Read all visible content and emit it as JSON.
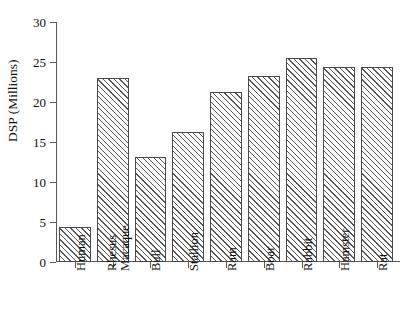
{
  "chart_data": {
    "type": "bar",
    "title": "",
    "subtitle": "",
    "xlabel": "",
    "ylabel": "DSP (Millions)",
    "categories": [
      "Human",
      "Rhesus Macaque",
      "Bull",
      "Stallion",
      "Ram",
      "Boar",
      "Rabbit",
      "Hamster",
      "Rat"
    ],
    "category_lines": [
      [
        "Human"
      ],
      [
        "Rhesus",
        "Macaque"
      ],
      [
        "Bull"
      ],
      [
        "Stallion"
      ],
      [
        "Ram"
      ],
      [
        "Boar"
      ],
      [
        "Rabbit"
      ],
      [
        "Hamster"
      ],
      [
        "Rat"
      ]
    ],
    "values": [
      4.4,
      23.0,
      13.1,
      16.2,
      21.2,
      23.3,
      25.5,
      24.4,
      24.4
    ],
    "ylim": [
      0,
      30
    ],
    "yticks": [
      0,
      5,
      10,
      15,
      20,
      25,
      30
    ],
    "ytick_labels": [
      "0",
      "5",
      "10",
      "15",
      "20",
      "25",
      "30"
    ],
    "grid": false,
    "legend": null,
    "legend_position": "none",
    "bar_style": {
      "fill": "#ffffff",
      "hatch": "diagonal-forward-slash",
      "hatch_color": "#555555",
      "edge_color": "#4a4a4a"
    },
    "axis_color": "#5a5a5a",
    "text_color": "#111111",
    "background": "#ffffff"
  }
}
